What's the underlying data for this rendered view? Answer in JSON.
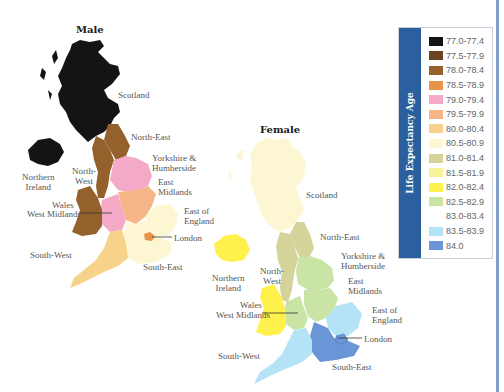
{
  "titles": {
    "male": "Male",
    "female": "Female"
  },
  "legend": {
    "title": "Life Expectancy Age",
    "bar_color": "#2c5f9e",
    "items": [
      {
        "label": "77.0-77.4",
        "color": "#141414"
      },
      {
        "label": "77.5-77.9",
        "color": "#6b4424"
      },
      {
        "label": "78.0-78.4",
        "color": "#94612d"
      },
      {
        "label": "78.5-78.9",
        "color": "#e8934a"
      },
      {
        "label": "79.0-79.4",
        "color": "#f4a9c6"
      },
      {
        "label": "79.5-79.9",
        "color": "#f6b586"
      },
      {
        "label": "80.0-80.4",
        "color": "#f6d28a"
      },
      {
        "label": "80.5-80.9",
        "color": "#fcf6d2"
      },
      {
        "label": "81.0-81.4",
        "color": "#d3d39a"
      },
      {
        "label": "81.5-81.9",
        "color": "#fbf39a"
      },
      {
        "label": "82.0-82.4",
        "color": "#fff14c"
      },
      {
        "label": "82.5-82.9",
        "color": "#c9e4a5"
      },
      {
        "label": "83.0-83.4",
        "color": "#ffffff"
      },
      {
        "label": "83.5-83.9",
        "color": "#b5e3f6"
      },
      {
        "label": "84.0",
        "color": "#6a95d6"
      }
    ]
  },
  "male_labels": {
    "scotland": "Scotland",
    "north_east": "North-East",
    "yorkshire": "Yorkshire &\nHumberside",
    "northern_ireland": "Northern\nIreland",
    "north_west": "North-\nWest",
    "east_midlands": "East\nMidlands",
    "wales": "Wales",
    "west_midlands": "West Midlands",
    "east_of_england": "East of\nEngland",
    "london": "London",
    "south_west": "South-West",
    "south_east": "South-East"
  },
  "female_labels": {
    "scotland": "Scotland",
    "north_east": "North-East",
    "yorkshire": "Yorkshire &\nHumberside",
    "northern_ireland": "Northern\nIreland",
    "north_west": "North-\nWest",
    "east_midlands": "East\nMidlands",
    "wales": "Wales",
    "west_midlands": "West Midlands",
    "east_of_england": "East of\nEngland",
    "london": "London",
    "south_west": "South-West",
    "south_east": "South-East"
  },
  "chart_data": {
    "type": "heatmap",
    "subtype": "choropleth",
    "legend_title": "Life Expectancy Age",
    "legend_position": "right",
    "bins": [
      "77.0-77.4",
      "77.5-77.9",
      "78.0-78.4",
      "78.5-78.9",
      "79.0-79.4",
      "79.5-79.9",
      "80.0-80.4",
      "80.5-80.9",
      "81.0-81.4",
      "81.5-81.9",
      "82.0-82.4",
      "82.5-82.9",
      "83.0-83.4",
      "83.5-83.9",
      "84.0"
    ],
    "categories": [
      "Scotland",
      "Northern Ireland",
      "North-East",
      "North-West",
      "Yorkshire & Humberside",
      "East Midlands",
      "West Midlands",
      "Wales",
      "East of England",
      "London",
      "South-West",
      "South-East"
    ],
    "series": [
      {
        "name": "Male",
        "values": [
          "77.0-77.4",
          "77.0-77.4",
          "78.0-78.4",
          "78.0-78.4",
          "79.0-79.4",
          "79.5-79.9",
          "79.0-79.4",
          "78.0-78.4",
          "80.5-80.9",
          "78.5-78.9",
          "80.0-80.4",
          "80.5-80.9"
        ]
      },
      {
        "name": "Female",
        "values": [
          "80.5-80.9",
          "82.0-82.4",
          "81.0-81.4",
          "81.0-81.4",
          "82.5-82.9",
          "82.5-82.9",
          "82.5-82.9",
          "82.0-82.4",
          "83.5-83.9",
          "83.5-83.9",
          "83.5-83.9",
          "84.0"
        ]
      }
    ]
  }
}
